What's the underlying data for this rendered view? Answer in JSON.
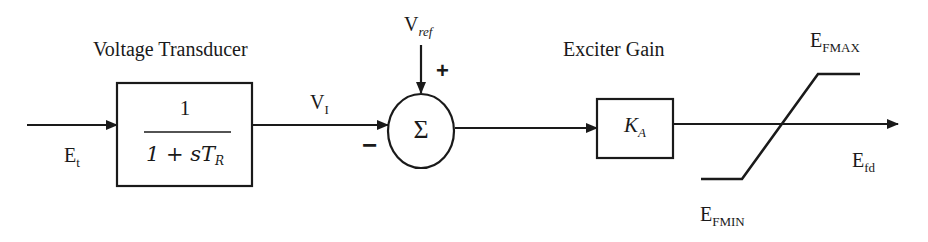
{
  "diagram": {
    "blocks": {
      "voltage_transducer": {
        "label": "Voltage Transducer",
        "numerator": "1",
        "denominator_prefix": "1 + sT",
        "denominator_sub": "R"
      },
      "summer": {
        "symbol": "Σ",
        "plus_sign": "+",
        "minus_sign": "−"
      },
      "exciter_gain": {
        "label": "Exciter Gain",
        "gain_main": "K",
        "gain_sub": "A"
      },
      "limiter": {
        "max_main": "E",
        "max_sub": "FMAX",
        "min_main": "E",
        "min_sub": "FMIN"
      }
    },
    "signals": {
      "input": {
        "main": "E",
        "sub": "t"
      },
      "transducer_output": {
        "main": "V",
        "sub": "I"
      },
      "reference": {
        "main": "V",
        "sub": "ref"
      },
      "output": {
        "main": "E",
        "sub": "fd"
      }
    },
    "colors": {
      "stroke": "#1a1a1a",
      "background": "#ffffff"
    }
  }
}
